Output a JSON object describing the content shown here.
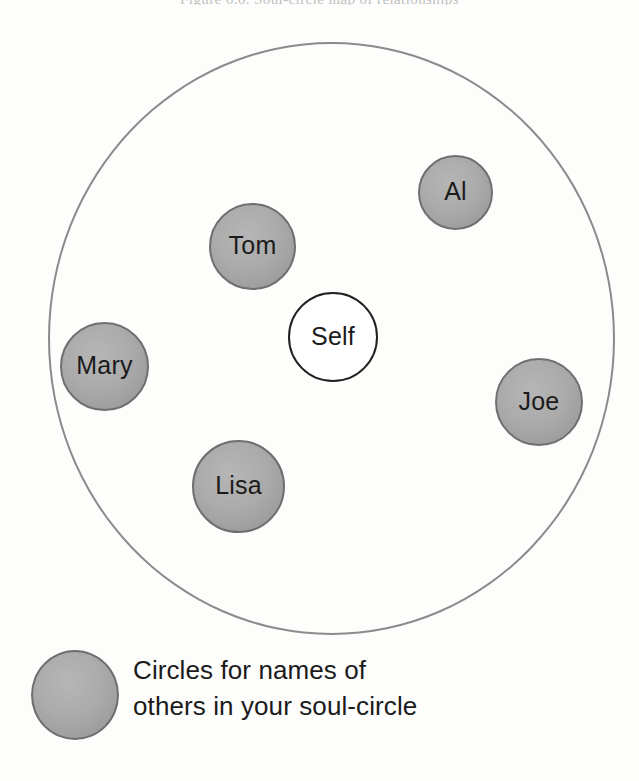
{
  "page": {
    "background_color": "#fdfdfc",
    "cropped_caption": "Figure 6.6. Soul-circle map of relationships"
  },
  "diagram": {
    "type": "soul-circle-map",
    "outer_circle": {
      "name": "soul-circle-boundary",
      "stroke_color": "#8b8b8b",
      "left": 48,
      "top": 42,
      "width": 567,
      "height": 593
    },
    "self_node": {
      "label": "Self",
      "fill_color": "#ffffff",
      "stroke_color": "#23201f",
      "left": 288,
      "top": 292,
      "size": 90
    },
    "other_nodes": [
      {
        "label": "Tom",
        "left": 209,
        "top": 203,
        "size": 87
      },
      {
        "label": "Al",
        "left": 418,
        "top": 155,
        "size": 75
      },
      {
        "label": "Mary",
        "left": 60,
        "top": 322,
        "size": 89
      },
      {
        "label": "Joe",
        "left": 495,
        "top": 358,
        "size": 88
      },
      {
        "label": "Lisa",
        "left": 192,
        "top": 440,
        "size": 93
      }
    ],
    "other_node_fill_color": "#ababab",
    "other_node_stroke_color": "#6f6f6f"
  },
  "legend": {
    "swatch_name": "legend-circle-swatch",
    "lines": [
      "Circles for names of",
      "others in your soul-circle"
    ]
  }
}
